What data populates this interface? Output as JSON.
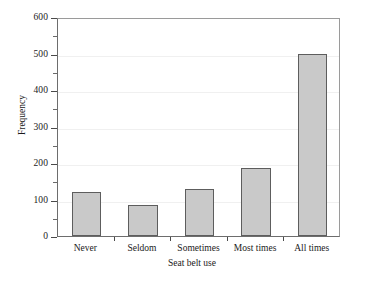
{
  "chart_data": {
    "type": "bar",
    "title": "",
    "categories": [
      "Never",
      "Seldom",
      "Sometimes",
      "Most times",
      "All times"
    ],
    "values": [
      120,
      85,
      130,
      185,
      500
    ],
    "xlabel": "Seat belt use",
    "ylabel": "Frequency",
    "ylim": [
      0,
      600
    ],
    "ytick_labels": [
      "0",
      "100",
      "200",
      "300",
      "400",
      "500",
      "600"
    ],
    "ytick_values": [
      0,
      100,
      200,
      300,
      400,
      500,
      600
    ],
    "yminor_tick_values": [
      50,
      150,
      250,
      350,
      450,
      550
    ],
    "grid": "horizontal-only",
    "legend": "none",
    "bar_fill_color": "#c9c9c9",
    "bar_edge_color": "#5d5d5d",
    "gridline_color": "#f0f0f0",
    "axis_color": "#4a4a4a",
    "background_color": "#ffffff"
  }
}
